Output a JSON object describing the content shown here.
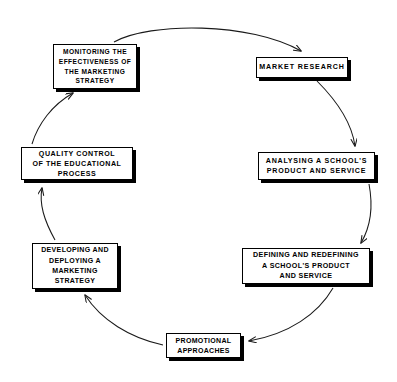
{
  "diagram": {
    "type": "cycle-diagram",
    "direction": "clockwise",
    "stroke_color": "#000000",
    "box_fill_color": "#ffffff",
    "shadow_color": "#000000",
    "background_color": "#ffffff",
    "node_count": 6,
    "nodes": [
      {
        "id": "market-research",
        "order": 1,
        "label": "MARKET RESEARCH",
        "position": "top-right"
      },
      {
        "id": "analysing",
        "order": 2,
        "label": "ANALYSING A SCHOOL'S\nPRODUCT AND SERVICE",
        "position": "right-upper"
      },
      {
        "id": "defining",
        "order": 3,
        "label": "DEFINING AND REDEFINING\nA SCHOOL'S PRODUCT\nAND SERVICE",
        "position": "right-lower"
      },
      {
        "id": "promotional",
        "order": 4,
        "label": "PROMOTIONAL\nAPPROACHES",
        "position": "bottom"
      },
      {
        "id": "developing",
        "order": 5,
        "label": "DEVELOPING AND\nDEPLOYING A\nMARKETING\nSTRATEGY",
        "position": "left-lower"
      },
      {
        "id": "quality",
        "order": 6,
        "label": "QUALITY CONTROL\nOF THE EDUCATIONAL\nPROCESS",
        "position": "left-upper"
      },
      {
        "id": "monitoring",
        "order": 7,
        "label": "MONITORING THE\nEFFECTIVENESS OF\nTHE MARKETING\nSTRATEGY",
        "position": "top-left"
      }
    ],
    "connections": [
      {
        "from": "monitoring",
        "to": "market-research",
        "style": "arc-arrow"
      },
      {
        "from": "market-research",
        "to": "analysing",
        "style": "arc-arrow"
      },
      {
        "from": "analysing",
        "to": "defining",
        "style": "arc-arrow"
      },
      {
        "from": "defining",
        "to": "promotional",
        "style": "arc-arrow"
      },
      {
        "from": "promotional",
        "to": "developing",
        "style": "arc-arrow"
      },
      {
        "from": "developing",
        "to": "quality",
        "style": "arc-arrow"
      },
      {
        "from": "quality",
        "to": "monitoring",
        "style": "arc-arrow"
      }
    ]
  }
}
